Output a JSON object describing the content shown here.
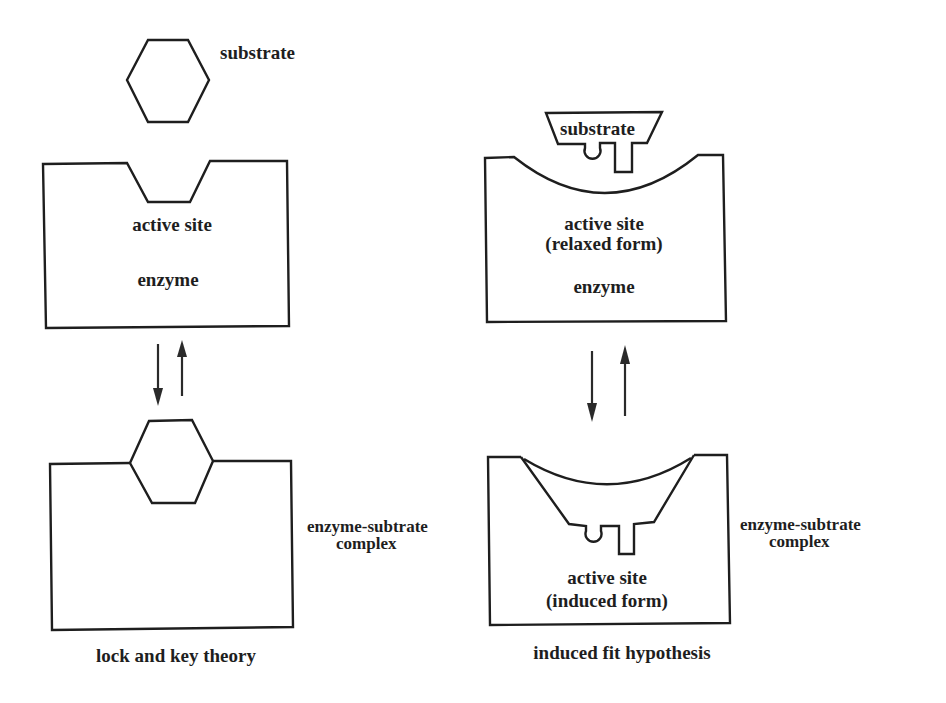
{
  "diagram": {
    "colors": {
      "line": "#1e1e1e",
      "background": "#ffffff"
    },
    "lock_and_key": {
      "caption": "lock and key theory",
      "top": {
        "substrate_label": "substrate",
        "substrate_shape": "hexagon",
        "enzyme_label": "enzyme",
        "active_site_label": "active site"
      },
      "arrows": {
        "forward": "down-arrow",
        "reverse": "up-arrow"
      },
      "bottom": {
        "complex_label_line1": "enzyme-subtrate",
        "complex_label_line2": "complex"
      }
    },
    "induced_fit": {
      "caption": "induced fit hypothesis",
      "top": {
        "substrate_label": "substrate",
        "substrate_shape": "trapezoid-with-knob-and-peg",
        "active_site_label_line1": "active site",
        "active_site_label_line2": "(relaxed form)",
        "enzyme_label": "enzyme"
      },
      "arrows": {
        "forward": "down-arrow",
        "reverse": "up-arrow"
      },
      "bottom": {
        "active_site_label_line1": "active site",
        "active_site_label_line2": "(induced form)",
        "complex_label_line1": "enzyme-subtrate",
        "complex_label_line2": "complex"
      }
    }
  }
}
